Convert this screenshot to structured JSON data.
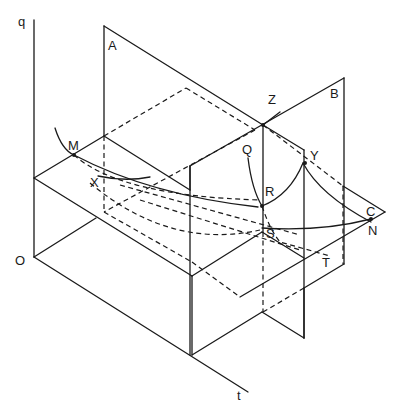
{
  "figure": {
    "type": "3d-isometric-diagram",
    "axes": {
      "vertical_label": "q",
      "origin_label": "O",
      "depth_label": "t"
    },
    "labels": {
      "A": "A",
      "B": "B",
      "Z": "Z",
      "M": "M",
      "X": "X",
      "Q": "Q",
      "R": "R",
      "Y": "Y",
      "S": "S",
      "T": "T",
      "C": "C",
      "N": "N"
    }
  }
}
